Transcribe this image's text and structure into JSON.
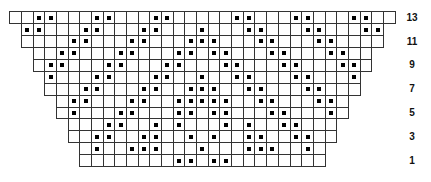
{
  "chart": {
    "type": "knitting-chart",
    "total_columns": 33,
    "cell_width": 11.68,
    "cell_height": 11.92,
    "origin_x": 9.7,
    "top_y": 11.7,
    "colors": {
      "grid": "#333333",
      "dot": "#000000",
      "background": "#ffffff"
    },
    "rows": [
      {
        "number": 13,
        "label": "13",
        "first": 1,
        "last": 33,
        "dots": [
          3,
          4,
          8,
          9,
          13,
          14,
          20,
          21,
          25,
          26,
          30,
          31
        ]
      },
      {
        "number": 12,
        "label": "",
        "first": 2,
        "last": 32,
        "dots": [
          2,
          3,
          7,
          8,
          12,
          13,
          17,
          21,
          22,
          26,
          27,
          31,
          32
        ]
      },
      {
        "number": 11,
        "label": "11",
        "first": 2,
        "last": 32,
        "dots": [
          6,
          7,
          11,
          12,
          16,
          17,
          18,
          22,
          23,
          27,
          28
        ]
      },
      {
        "number": 10,
        "label": "",
        "first": 3,
        "last": 31,
        "dots": [
          5,
          6,
          10,
          11,
          15,
          16,
          18,
          19,
          23,
          24,
          28,
          29
        ]
      },
      {
        "number": 9,
        "label": "9",
        "first": 3,
        "last": 31,
        "dots": [
          4,
          5,
          9,
          10,
          14,
          15,
          19,
          20,
          24,
          25,
          29,
          30
        ]
      },
      {
        "number": 8,
        "label": "",
        "first": 4,
        "last": 30,
        "dots": [
          4,
          8,
          9,
          13,
          14,
          17,
          20,
          21,
          25,
          26,
          30
        ]
      },
      {
        "number": 7,
        "label": "7",
        "first": 4,
        "last": 30,
        "dots": [
          7,
          8,
          12,
          13,
          16,
          17,
          18,
          21,
          22,
          26,
          27
        ]
      },
      {
        "number": 6,
        "label": "",
        "first": 5,
        "last": 29,
        "dots": [
          6,
          7,
          11,
          12,
          15,
          16,
          17,
          18,
          19,
          22,
          23,
          27,
          28
        ]
      },
      {
        "number": 5,
        "label": "5",
        "first": 5,
        "last": 29,
        "dots": [
          6,
          10,
          11,
          15,
          16,
          18,
          19,
          23,
          24,
          28
        ]
      },
      {
        "number": 4,
        "label": "",
        "first": 6,
        "last": 28,
        "dots": [
          9,
          10,
          13,
          15,
          19,
          21,
          24,
          25
        ]
      },
      {
        "number": 3,
        "label": "3",
        "first": 6,
        "last": 28,
        "dots": [
          8,
          9,
          12,
          13,
          16,
          18,
          21,
          22,
          25,
          26
        ]
      },
      {
        "number": 2,
        "label": "",
        "first": 7,
        "last": 27,
        "dots": [
          8,
          11,
          12,
          13,
          17,
          21,
          22,
          23,
          26
        ]
      },
      {
        "number": 1,
        "label": "1",
        "first": 7,
        "last": 27,
        "dots": [
          15,
          16,
          18,
          19
        ]
      }
    ],
    "label_x": 402
  }
}
